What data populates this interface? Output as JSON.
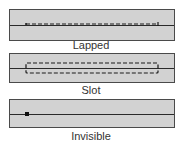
{
  "diagram": {
    "panels": [
      {
        "id": "lapped",
        "label": "Lapped"
      },
      {
        "id": "slot",
        "label": "Slot"
      },
      {
        "id": "invisible",
        "label": "Invisible"
      }
    ],
    "colors": {
      "fabric": "#d2d2d2",
      "outline": "#4a4a4a",
      "seam": "#2a2a2a",
      "stitch": "#1a1a1a"
    }
  }
}
